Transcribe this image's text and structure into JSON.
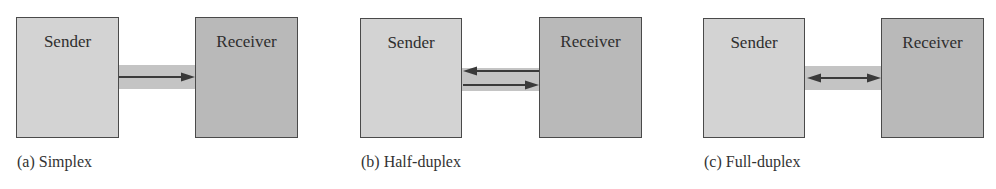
{
  "diagram": {
    "panels": [
      {
        "id": "simplex",
        "caption": "(a) Simplex",
        "sender": "Sender",
        "receiver": "Receiver",
        "arrows": [
          "sender-to-receiver"
        ]
      },
      {
        "id": "half-duplex",
        "caption": "(b) Half-duplex",
        "sender": "Sender",
        "receiver": "Receiver",
        "arrows": [
          "receiver-to-sender",
          "sender-to-receiver"
        ]
      },
      {
        "id": "full-duplex",
        "caption": "(c) Full-duplex",
        "sender": "Sender",
        "receiver": "Receiver",
        "arrows": [
          "bidirectional"
        ]
      }
    ],
    "colors": {
      "sender_fill": "#d3d3d3",
      "receiver_fill": "#b9b9b9",
      "channel_band": "#c4c4c4",
      "border": "#4a4a4a",
      "arrow": "#3a3a3a"
    }
  }
}
